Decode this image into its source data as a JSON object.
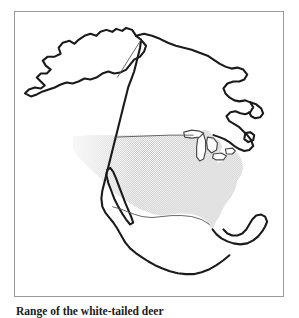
{
  "figure": {
    "caption": "Range of the white-tailed deer",
    "frame": {
      "border_color": "#9b9b9b",
      "background_color": "#ffffff"
    }
  },
  "map": {
    "title": "North America",
    "projection_note": "",
    "coastline_color": "#1a1a1a",
    "border_color": "#555555",
    "lake_color": "#ffffff",
    "range_fill_color": "#c8c8c8",
    "range_pattern": "stipple",
    "regions": [
      {
        "name": "alaska",
        "label": "Alaska",
        "shaded": false
      },
      {
        "name": "canada",
        "label": "Canada",
        "shaded": false
      },
      {
        "name": "continental-united-states",
        "label": "Continental United States",
        "shaded": true
      },
      {
        "name": "mexico",
        "label": "Mexico",
        "shaded": false
      },
      {
        "name": "central-america",
        "label": "Central America",
        "shaded": false
      },
      {
        "name": "baja-california",
        "label": "Baja California",
        "shaded": false
      },
      {
        "name": "great-lakes",
        "label": "Great Lakes",
        "shaded": false
      },
      {
        "name": "florida",
        "label": "Florida",
        "shaded": true
      },
      {
        "name": "nova-scotia",
        "label": "Nova Scotia",
        "shaded": false
      }
    ],
    "boundaries": [
      {
        "name": "alaska-yukon-border",
        "style": "thin-line"
      },
      {
        "name": "forty-ninth-parallel",
        "style": "thin-line"
      },
      {
        "name": "us-mexico-border",
        "style": "thin-line"
      }
    ],
    "legend": {
      "visible": false,
      "shaded_meaning": "Range"
    }
  }
}
